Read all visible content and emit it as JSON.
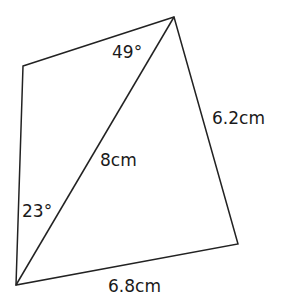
{
  "diagram": {
    "type": "quadrilateral-with-diagonal",
    "vertices": {
      "top_left": [
        23,
        66
      ],
      "top_right": [
        174,
        17
      ],
      "bottom_right": [
        238,
        244
      ],
      "bottom_left": [
        16,
        285
      ]
    },
    "line_color": "#222222",
    "labels": {
      "angle_top": "49°",
      "angle_bottom": "23°",
      "diagonal": "8cm",
      "right_side": "6.2cm",
      "bottom_side": "6.8cm"
    }
  }
}
